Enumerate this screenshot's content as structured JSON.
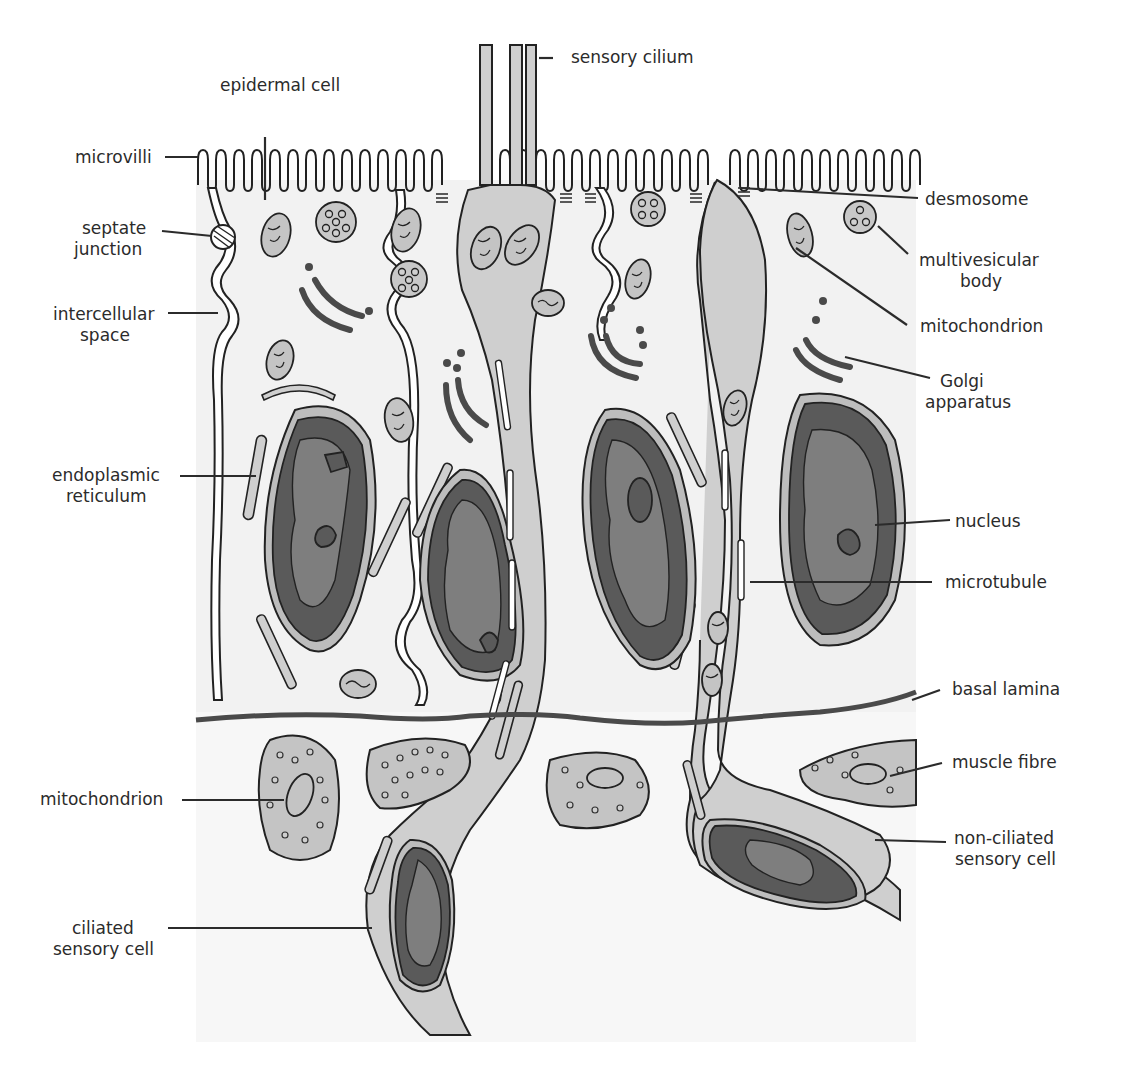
{
  "figure": {
    "colors": {
      "background": "#ffffff",
      "cytoplasm": "#f2f2f2",
      "sensory_cell": "#cfcfcf",
      "nucleus_dark": "#5a5a5a",
      "nucleus_mid": "#7e7e7e",
      "organelle_fill": "#c4c4c4",
      "outline": "#222222",
      "label_text": "#2b2b2b"
    }
  },
  "labels": {
    "left": {
      "epidermal_cell": "epidermal cell",
      "microvilli": "microvilli",
      "septate_junction_1": "septate",
      "septate_junction_2": "junction",
      "intercellular_space_1": "intercellular",
      "intercellular_space_2": "space",
      "endoplasmic_reticulum_1": "endoplasmic",
      "endoplasmic_reticulum_2": "reticulum",
      "mitochondrion": "mitochondrion",
      "ciliated_sensory_cell_1": "ciliated",
      "ciliated_sensory_cell_2": "sensory cell"
    },
    "top": {
      "sensory_cilium": "sensory cilium"
    },
    "right": {
      "desmosome": "desmosome",
      "multivesicular_body_1": "multivesicular",
      "multivesicular_body_2": "body",
      "mitochondrion": "mitochondrion",
      "golgi_apparatus_1": "Golgi",
      "golgi_apparatus_2": "apparatus",
      "nucleus": "nucleus",
      "microtubule": "microtubule",
      "basal_lamina": "basal lamina",
      "muscle_fibre": "muscle fibre",
      "non_ciliated_sensory_cell_1": "non-ciliated",
      "non_ciliated_sensory_cell_2": "sensory cell"
    }
  }
}
